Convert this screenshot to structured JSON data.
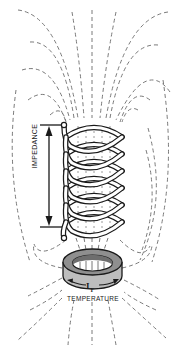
{
  "diagram": {
    "title": "",
    "labels": {
      "impedance": "IMPEDANCE",
      "temperature": "TEMPERATURE",
      "current": "IT"
    },
    "components": [
      {
        "name": "helical coil",
        "turns": 6
      },
      {
        "name": "magnetic field lines",
        "style": "dashed"
      },
      {
        "name": "impedance dimension arrow",
        "orientation": "vertical"
      },
      {
        "name": "toroidal ring",
        "annotation": "circulating current arrows"
      }
    ],
    "colors": {
      "ink": "#1a1a1a",
      "field_lines": "#7a7a7a",
      "background": "#ffffff"
    }
  }
}
